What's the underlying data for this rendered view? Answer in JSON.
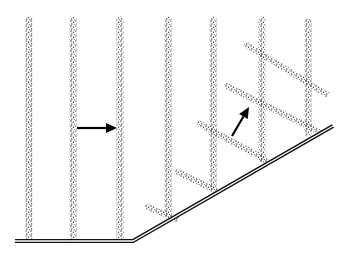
{
  "diagram": {
    "title": "",
    "colors": {
      "background": "#ffffff",
      "line": "#111111",
      "stipple": "#222222"
    },
    "ground": {
      "points": [
        [
          15,
          241
        ],
        [
          133,
          241
        ],
        [
          333,
          126
        ]
      ],
      "style": "double-line"
    },
    "vertical_stripes": [
      {
        "x": 29,
        "y1": 20,
        "y2": 240
      },
      {
        "x": 73,
        "y1": 20,
        "y2": 240
      },
      {
        "x": 120,
        "y1": 20,
        "y2": 240
      },
      {
        "x": 168,
        "y1": 20,
        "y2": 213
      },
      {
        "x": 213,
        "y1": 20,
        "y2": 187
      },
      {
        "x": 262,
        "y1": 20,
        "y2": 159
      },
      {
        "x": 308,
        "y1": 22,
        "y2": 133
      }
    ],
    "diagonal_stripes": [
      {
        "x1": 247,
        "y1": 45,
        "x2": 326,
        "y2": 94
      },
      {
        "x1": 227,
        "y1": 86,
        "x2": 318,
        "y2": 131
      },
      {
        "x1": 200,
        "y1": 124,
        "x2": 266,
        "y2": 160
      },
      {
        "x1": 178,
        "y1": 172,
        "x2": 215,
        "y2": 190
      },
      {
        "x1": 148,
        "y1": 207,
        "x2": 176,
        "y2": 219
      }
    ],
    "arrows": [
      {
        "name": "horizontal-arrow",
        "from": [
          77,
          128
        ],
        "to": [
          117,
          128
        ]
      },
      {
        "name": "diagonal-arrow",
        "from": [
          232,
          136
        ],
        "to": [
          249,
          107
        ]
      }
    ]
  }
}
